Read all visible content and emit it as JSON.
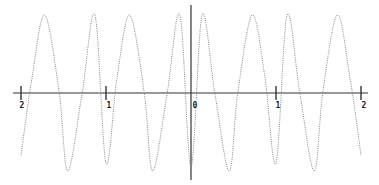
{
  "chart_data": {
    "type": "line",
    "title": "",
    "xlabel": "",
    "ylabel": "",
    "xlim": [
      -2.05,
      2.05
    ],
    "ylim": [
      -1,
      1
    ],
    "grid": false,
    "legend": null,
    "x_ticks": [
      -2,
      -1,
      0,
      1,
      2
    ],
    "x_tick_labels": [
      "2",
      "1",
      "0",
      "1",
      "2"
    ],
    "series": [
      {
        "name": "oscillation",
        "style": "dotted",
        "description": "Periodic oscillation symmetric about x=0, troughs near x=0, ±0.45, ±1.45; peaks near ±0.13, ±0.72, ±1.13, ±1.72",
        "x": [
          -2.0,
          -1.87,
          -1.72,
          -1.55,
          -1.45,
          -1.28,
          -1.13,
          -1.0,
          -0.87,
          -0.72,
          -0.55,
          -0.45,
          -0.28,
          -0.13,
          0.0,
          0.13,
          0.28,
          0.45,
          0.55,
          0.72,
          0.87,
          1.0,
          1.13,
          1.28,
          1.45,
          1.55,
          1.72,
          1.87,
          2.0
        ],
        "y": [
          -0.8,
          0.2,
          1.0,
          0.0,
          -1.0,
          0.0,
          1.0,
          -0.9,
          0.2,
          1.0,
          0.0,
          -1.0,
          0.0,
          1.0,
          -0.95,
          1.0,
          0.0,
          -1.0,
          0.0,
          1.0,
          0.2,
          -0.9,
          1.0,
          0.0,
          -1.0,
          0.0,
          1.0,
          0.2,
          -0.8
        ]
      }
    ]
  },
  "axes": {
    "x_axis_color": "#333333",
    "y_axis_color": "#333333",
    "curve_color": "#888888"
  },
  "labels": {
    "neg2": "2",
    "neg1": "1",
    "zero": "0",
    "pos1": "1",
    "pos2": "2"
  }
}
